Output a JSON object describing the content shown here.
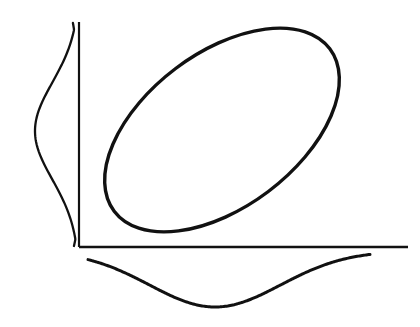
{
  "figure": {
    "title": "Bivariate normal distribution with concentration ellipse and marginal density curves",
    "caption": "",
    "background_color": "#ffffff",
    "ink_color": "#111111",
    "width": 420,
    "height": 327
  },
  "axes": {
    "origin": {
      "x": 79,
      "y": 247
    },
    "y_axis": {
      "label": "",
      "x": 79,
      "y_top": 22,
      "y_bottom": 247,
      "stroke_width": 2.2,
      "color": "#111111"
    },
    "x_axis": {
      "label": "",
      "y": 247,
      "x_left": 79,
      "x_right": 408,
      "stroke_width": 2.6,
      "color": "#111111"
    }
  },
  "ellipse": {
    "name": "concentration-ellipse",
    "center": {
      "x": 222,
      "y": 130
    },
    "semi_major": 135,
    "semi_minor": 77,
    "rotation_deg": -37,
    "stroke_width": 3.4,
    "color": "#111111",
    "bounds": {
      "left": 99,
      "right": 345,
      "top": 27,
      "bottom": 234
    }
  },
  "marginal_y": {
    "name": "left-marginal-density",
    "orientation": "vertical",
    "peak": {
      "x": 35,
      "y": 131
    },
    "baseline_x": 79,
    "start": {
      "x": 73,
      "y": 23
    },
    "end": {
      "x": 80,
      "y": 246
    },
    "stroke_width": 2.3,
    "color": "#111111"
  },
  "marginal_x": {
    "name": "bottom-marginal-density",
    "orientation": "horizontal",
    "peak": {
      "x": 215,
      "y": 307
    },
    "baseline_y": 251,
    "start": {
      "x": 88,
      "y": 253
    },
    "end": {
      "x": 370,
      "y": 252
    },
    "stroke_width": 3.0,
    "color": "#111111"
  },
  "chart_data": {
    "type": "line",
    "subtitle": "",
    "xlabel": "",
    "ylabel": "",
    "grid": false,
    "legend_position": "none",
    "xlim": [
      0,
      420
    ],
    "ylim": [
      0,
      327
    ],
    "annotations": [],
    "series": [
      {
        "name": "concentration-ellipse",
        "kind": "ellipse",
        "center_px": [
          222,
          130
        ],
        "semi_axes_px": [
          135,
          77
        ],
        "rotation_deg": -37,
        "correlation_sign": "positive",
        "description": "Tilted ellipse rising to the right, indicating positive correlation between X and Y"
      },
      {
        "name": "marginal-density-y",
        "kind": "density",
        "axis": "y",
        "drawn_side": "left-of-y-axis",
        "mode_px": [
          35,
          131
        ],
        "spread_px": 52,
        "tail_top_px": [
          73,
          23
        ],
        "tail_bottom_px": [
          80,
          246
        ],
        "description": "Bell-shaped marginal density of Y drawn sideways to the left of the vertical axis"
      },
      {
        "name": "marginal-density-x",
        "kind": "density",
        "axis": "x",
        "drawn_side": "below-x-axis",
        "mode_px": [
          215,
          307
        ],
        "spread_px": 70,
        "tail_left_px": [
          88,
          253
        ],
        "tail_right_px": [
          370,
          252
        ],
        "description": "Bell-shaped marginal density of X drawn inverted below the horizontal axis"
      }
    ]
  }
}
